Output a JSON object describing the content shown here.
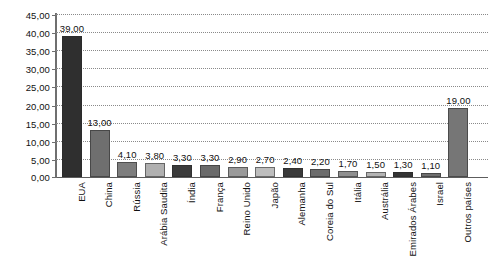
{
  "chart_data": {
    "type": "bar",
    "title": "",
    "subtitle": "",
    "xlabel": "",
    "ylabel": "",
    "ylim": [
      0,
      45
    ],
    "ytick_step": 5,
    "grid": true,
    "legend": null,
    "legend_position": "none",
    "value_label_format": "comma-decimal",
    "categories": [
      "EUA",
      "China",
      "Rússia",
      "Arábia Saudita",
      "Índia",
      "França",
      "Reino Unido",
      "Japão",
      "Alemanha",
      "Coreia do Sul",
      "Itália",
      "Austrália",
      "Emirados Árabes",
      "Israel",
      "Outros países"
    ],
    "values": [
      39.0,
      13.0,
      4.1,
      3.8,
      3.3,
      3.3,
      2.9,
      2.7,
      2.4,
      2.2,
      1.7,
      1.5,
      1.3,
      1.1,
      19.0
    ],
    "value_labels": [
      "39,00",
      "13,00",
      "4,10",
      "3,80",
      "3,30",
      "3,30",
      "2,90",
      "2,70",
      "2,40",
      "2,20",
      "1,70",
      "1,50",
      "1,30",
      "1,10",
      "19,00"
    ],
    "bar_colors": [
      "#2f2f2f",
      "#6f6f6f",
      "#7d7d7d",
      "#b0b0b0",
      "#3b3b3b",
      "#6a6a6a",
      "#9a9a9a",
      "#bdbdbd",
      "#3a3a3a",
      "#6c6c6c",
      "#8f8f8f",
      "#b4b4b4",
      "#343434",
      "#6e6e6e",
      "#767676"
    ],
    "ytick_labels": [
      "0,00",
      "5,00",
      "10,00",
      "15,00",
      "20,00",
      "25,00",
      "30,00",
      "35,00",
      "40,00",
      "45,00"
    ],
    "ytick_values": [
      0,
      5,
      10,
      15,
      20,
      25,
      30,
      35,
      40,
      45
    ],
    "axis_color": "#6f6f6f",
    "gridline_color": "#8a8a8a",
    "background": "#ffffff"
  }
}
